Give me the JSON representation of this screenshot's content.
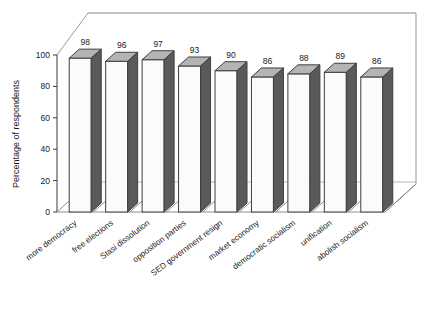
{
  "chart_data": {
    "type": "bar",
    "title": "",
    "xlabel": "",
    "ylabel": "Percentage of respondents",
    "ylim": [
      0,
      100
    ],
    "yticks": [
      "0",
      "20",
      "40",
      "60",
      "80",
      "100"
    ],
    "grid": true,
    "legend": "none",
    "projection": "3d-bar",
    "categories": [
      "more democracy",
      "free elections",
      "Stasi dissolution",
      "opposition parties",
      "SED government resign",
      "market economy",
      "democratic socialism",
      "unification",
      "abolish socialism"
    ],
    "values": [
      98,
      96,
      97,
      93,
      90,
      86,
      88,
      89,
      86
    ],
    "value_labels": [
      "98",
      "96",
      "97",
      "93",
      "90",
      "86",
      "88",
      "89",
      "86"
    ],
    "colors": {
      "bar_front": "#fbfbfb",
      "bar_top": "#b4b4b4",
      "bar_side": "#5a5a5a",
      "bar_outline": "#3f3f3f",
      "axis": "#3a3a3a",
      "grid": "#b8b8b8",
      "frame": "#9a9a9a",
      "background": "#ffffff",
      "text": "#1a1a1a"
    }
  }
}
